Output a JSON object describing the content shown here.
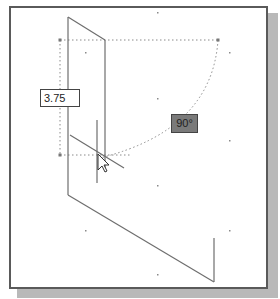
{
  "canvas": {
    "background": "#ffffff",
    "border_color": "#5a5a5a",
    "shadow_color": "#b9b9b9"
  },
  "dimension_input": {
    "value": "3.75"
  },
  "angle_display": {
    "value": "90°",
    "background": "#7a7a7a"
  },
  "cursor": {
    "icon": "arrow-pointer-icon"
  }
}
